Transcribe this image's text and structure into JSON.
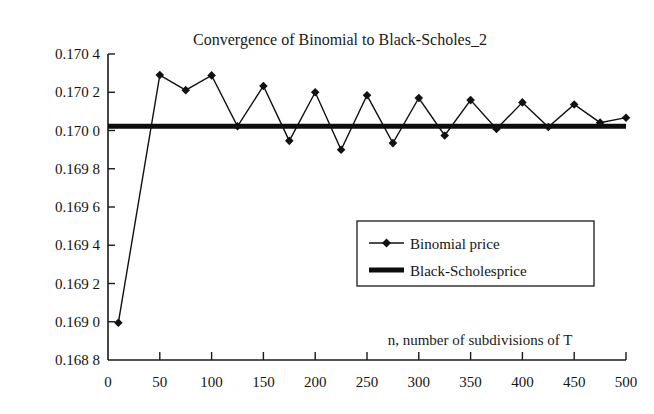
{
  "chart_data": {
    "type": "line",
    "title": "Convergence of Binomial to Black-Scholes_2",
    "xlabel": "n, number of subdivisions of T",
    "ylabel": "",
    "xlim": [
      0,
      500
    ],
    "ylim": [
      0.1688,
      0.1704
    ],
    "grid": false,
    "legend_position": "center-right",
    "x_ticks": [
      0,
      50,
      100,
      150,
      200,
      250,
      300,
      350,
      400,
      450,
      500
    ],
    "x_tick_labels": [
      "0",
      "50",
      "100",
      "150",
      "200",
      "250",
      "300",
      "350",
      "400",
      "450",
      "500"
    ],
    "y_ticks": [
      0.1688,
      0.169,
      0.1692,
      0.1694,
      0.1696,
      0.1698,
      0.17,
      0.1702,
      0.1704
    ],
    "y_tick_labels": [
      "0.168 8",
      "0.169 0",
      "0.169 2",
      "0.169 4",
      "0.169 6",
      "0.169 8",
      "0.170 0",
      "0.170 2",
      "0.170 4"
    ],
    "series": [
      {
        "name": "Binomial price",
        "style": "line-marker",
        "marker": "diamond",
        "color": "#111111",
        "x": [
          10,
          50,
          75,
          100,
          125,
          150,
          175,
          200,
          225,
          250,
          275,
          300,
          325,
          350,
          375,
          400,
          425,
          450,
          475,
          500
        ],
        "values": [
          0.168995,
          0.17029,
          0.170211,
          0.170288,
          0.170022,
          0.170233,
          0.169946,
          0.1702,
          0.169899,
          0.170184,
          0.169934,
          0.17017,
          0.169974,
          0.170159,
          0.170008,
          0.170147,
          0.170018,
          0.170136,
          0.170041,
          0.170067
        ]
      },
      {
        "name": "Black-Scholesprice",
        "style": "thick-line",
        "color": "#0d0d0d",
        "x": [
          0,
          500
        ],
        "values": [
          0.170022,
          0.170022
        ]
      }
    ]
  },
  "legend": {
    "entries": [
      {
        "label": "Binomial price",
        "swatch": "line-with-diamond-marker"
      },
      {
        "label": "Black-Scholesprice",
        "swatch": "thick-line"
      }
    ]
  },
  "colors": {
    "series_binomial": "#111111",
    "series_black_scholes": "#0d0d0d",
    "axis": "#1a1a1a",
    "background": "#ffffff"
  }
}
